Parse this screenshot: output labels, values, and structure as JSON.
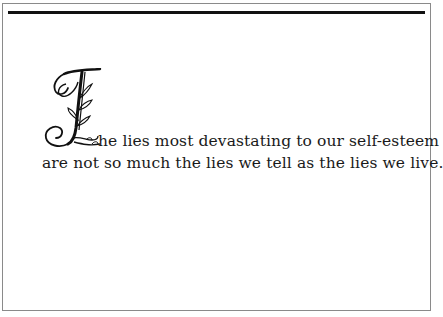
{
  "page": {
    "border_color": "#8a8a8a",
    "rule_color": "#111111",
    "text_color": "#1a1a1a"
  },
  "quote": {
    "drop_cap": "T",
    "line1": "he lies most devastating to our self-esteem",
    "line2": "are not so much the lies we tell as the lies we live."
  }
}
